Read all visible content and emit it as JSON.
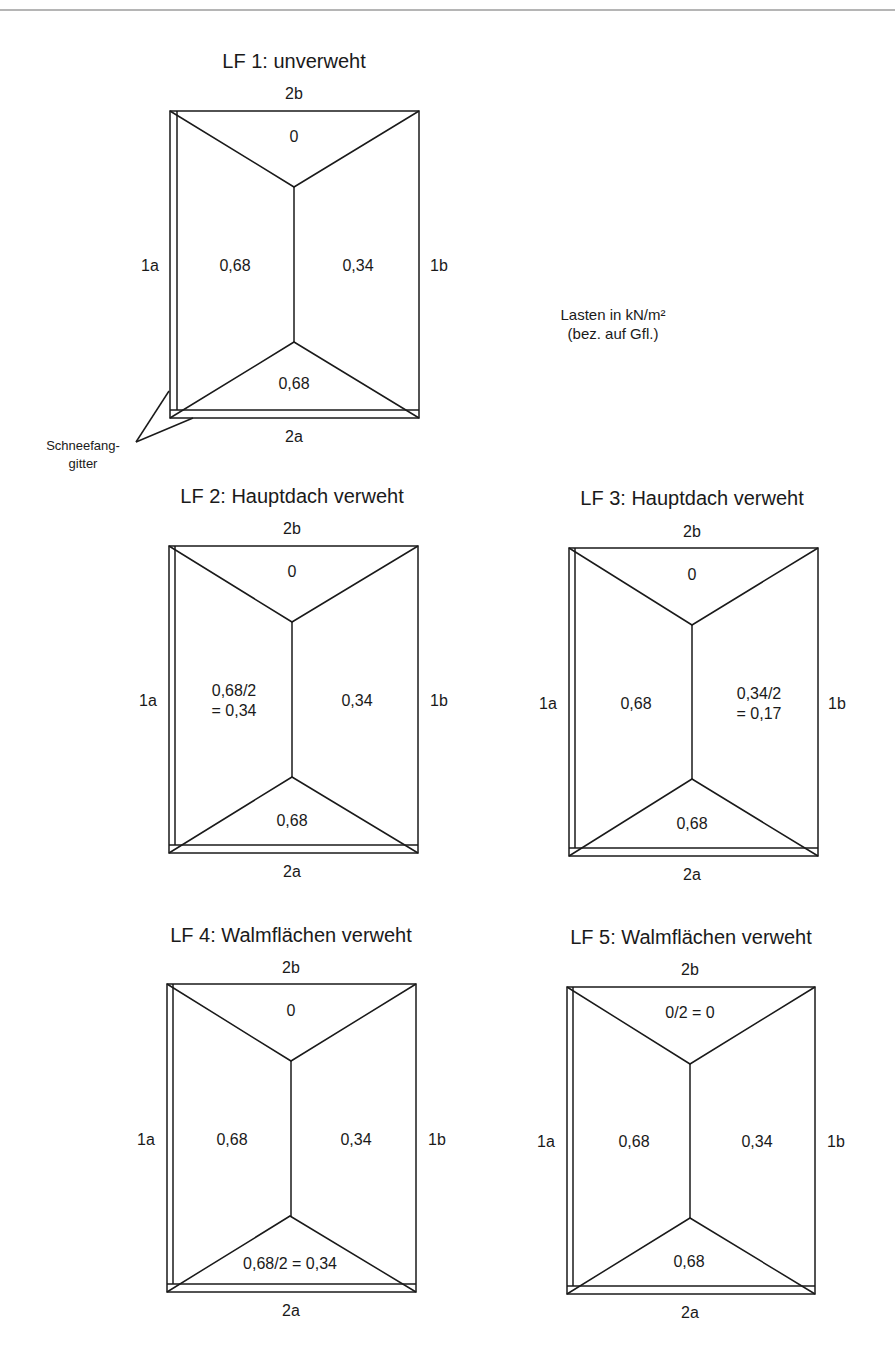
{
  "legend": {
    "units_line1": "Lasten in kN/m²",
    "units_line2": "(bez. auf Gfl.)"
  },
  "annotation": {
    "line1": "Schneefang-",
    "line2": "gitter"
  },
  "side_labels": {
    "top": "2b",
    "bottom": "2a",
    "left": "1a",
    "right": "1b"
  },
  "load_cases": [
    {
      "title": "LF 1: unverweht",
      "top": "0",
      "left": "0,68",
      "left2": "",
      "right": "0,34",
      "right2": "",
      "bottom": "0,68"
    },
    {
      "title": "LF 2: Hauptdach verweht",
      "top": "0",
      "left": "0,68/2",
      "left2": "= 0,34",
      "right": "0,34",
      "right2": "",
      "bottom": "0,68"
    },
    {
      "title": "LF 3: Hauptdach verweht",
      "top": "0",
      "left": "0,68",
      "left2": "",
      "right": "0,34/2",
      "right2": "= 0,17",
      "bottom": "0,68"
    },
    {
      "title": "LF 4: Walmflächen verweht",
      "top": "0",
      "left": "0,68",
      "left2": "",
      "right": "0,34",
      "right2": "",
      "bottom": "0,68/2 = 0,34"
    },
    {
      "title": "LF 5: Walmflächen verweht",
      "top": "0/2 = 0",
      "left": "0,68",
      "left2": "",
      "right": "0,34",
      "right2": "",
      "bottom": "0,68"
    }
  ]
}
